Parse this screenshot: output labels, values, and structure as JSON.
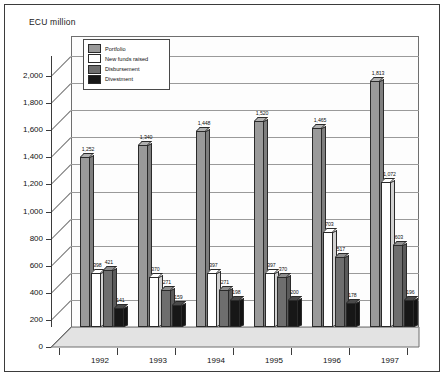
{
  "chart_data": {
    "type": "bar",
    "title": "",
    "ylabel": "ECU million",
    "xlabel": "",
    "categories": [
      "1992",
      "1993",
      "1994",
      "1995",
      "1996",
      "1997"
    ],
    "ylim": [
      0,
      2000
    ],
    "yticks": [
      "0",
      "200",
      "400",
      "600",
      "800",
      "1,000",
      "1,200",
      "1,400",
      "1,600",
      "1,800",
      "2,000"
    ],
    "grid": true,
    "legend_position": "top-left-inside",
    "series": [
      {
        "name": "Portfolio",
        "color": "#9a9a9a",
        "values": [
          1252,
          1340,
          1448,
          1520,
          1465,
          1813
        ],
        "labels": [
          "1,252",
          "1,340",
          "1,448",
          "1,520",
          "1,465",
          "1,813"
        ]
      },
      {
        "name": "New funds raised",
        "color": "#ffffff",
        "values": [
          398,
          370,
          397,
          397,
          703,
          1072
        ],
        "labels": [
          "398",
          "370",
          "397",
          "397",
          "703",
          "1,072"
        ]
      },
      {
        "name": "Disbursement",
        "color": "#6e6e6e",
        "values": [
          421,
          271,
          271,
          370,
          517,
          603
        ],
        "labels": [
          "421",
          "271",
          "271",
          "370",
          "517",
          "603"
        ]
      },
      {
        "name": "Divestment",
        "color": "#171717",
        "values": [
          141,
          159,
          198,
          200,
          178,
          196
        ],
        "labels": [
          "141",
          "159",
          "198",
          "200",
          "178",
          "196"
        ]
      }
    ]
  },
  "legend": {
    "items": [
      {
        "label": "Portfolio",
        "color": "#9a9a9a"
      },
      {
        "label": "New funds raised",
        "color": "#ffffff"
      },
      {
        "label": "Disbursement",
        "color": "#6e6e6e"
      },
      {
        "label": "Divestment",
        "color": "#171717"
      }
    ]
  },
  "axis": {
    "y_title": "ECU million"
  }
}
